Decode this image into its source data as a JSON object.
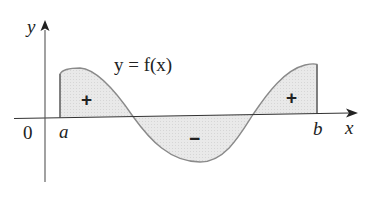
{
  "figure": {
    "axes": {
      "x_label": "x",
      "y_label": "y",
      "origin_label": "0"
    },
    "curve_label": "y = f(x)",
    "bounds": {
      "left": "a",
      "right": "b"
    },
    "regions": [
      {
        "sign": "+",
        "position": "left, above x-axis"
      },
      {
        "sign": "−",
        "position": "middle, below x-axis"
      },
      {
        "sign": "+",
        "position": "right, above x-axis"
      }
    ],
    "colors": {
      "fill": "#e6e6e6",
      "curve": "#8a8a8a",
      "axis": "#333333",
      "text": "#222222"
    }
  }
}
